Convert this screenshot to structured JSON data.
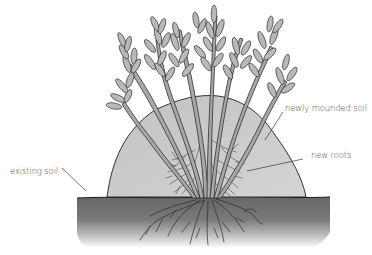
{
  "diagram": {
    "labels": {
      "newly_mounded_soil": "newly mounded soil",
      "new_roots": "new roots",
      "existing_soil": "existing soil"
    },
    "colors": {
      "background": "#ffffff",
      "mound_fill": "#c9c9c9",
      "existing_soil_fill": "#6e6e6e",
      "outline": "#1e1e1e",
      "stem_fill": "#a8a8a8",
      "leaf_fill": "#b9b9b9",
      "label_text": "#4a4a4a"
    }
  }
}
